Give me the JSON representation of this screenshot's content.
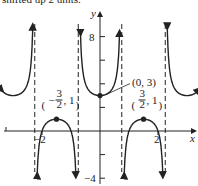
{
  "header": {
    "cropped_text": "shifted up 2 units."
  },
  "chart_data": {
    "type": "line",
    "title": "",
    "xlabel": "x",
    "ylabel": "y",
    "x_ticks": [
      {
        "value": -2,
        "label": "−2"
      },
      {
        "value": 2,
        "label": "2"
      }
    ],
    "y_ticks": [
      {
        "value": 8,
        "label": "8"
      },
      {
        "value": -4,
        "label": "−4"
      }
    ],
    "xlim": [
      -3.4,
      3.4
    ],
    "ylim": [
      -5,
      9
    ],
    "asymptotes_x": [
      -2.25,
      -0.75,
      0.75,
      2.25
    ],
    "points": [
      {
        "x": 0,
        "y": 3,
        "label": "(0, 3)"
      },
      {
        "x": -1.5,
        "y": 1,
        "label": "(−3/2, 1)"
      },
      {
        "x": 1.5,
        "y": 1,
        "label": "(3/2, 1)"
      }
    ],
    "function": "y = 2 + sec(2πx/3)"
  }
}
